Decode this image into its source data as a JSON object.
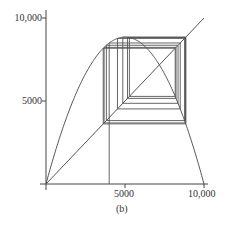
{
  "figure": {
    "caption": "(b)",
    "x_ticks": [
      "5000",
      "10,000"
    ],
    "y_ticks": [
      "10,000",
      "5000"
    ]
  },
  "style": {
    "line_color": "#555555",
    "axis_color": "#444444"
  },
  "chart_data": {
    "type": "line",
    "title": "",
    "caption": "(b)",
    "xlabel": "",
    "ylabel": "",
    "xlim": [
      0,
      10000
    ],
    "ylim": [
      0,
      10000
    ],
    "x_tick_labels": [
      "5000",
      "10,000"
    ],
    "y_tick_labels": [
      "5000",
      "10,000"
    ],
    "grid": false,
    "legend": null,
    "series": [
      {
        "name": "logistic map parabola",
        "description": "f(x) = r x (1 - x/K), r ≈ 3.54, K = 10000, peak ≈ 8850 at x = 5000",
        "r": 3.54,
        "K": 10000,
        "x": [
          0,
          1000,
          2000,
          3000,
          4000,
          5000,
          6000,
          7000,
          8000,
          9000,
          10000
        ],
        "values": [
          0,
          3186,
          5664,
          7434,
          8496,
          8850,
          8496,
          7434,
          5664,
          3186,
          0
        ]
      },
      {
        "name": "identity line y = x",
        "x": [
          0,
          10000
        ],
        "values": [
          0,
          10000
        ]
      },
      {
        "name": "cobweb iterates",
        "x0": 4000,
        "iterates": [
          4000,
          8496,
          4524,
          8770,
          3820,
          8357,
          4861,
          8843,
          3621,
          8177,
          5277,
          8823,
          3677,
          8230,
          5157,
          8841,
          3627
        ]
      }
    ],
    "annotations": [
      "fixed point at ≈ 7175 where parabola meets y = x"
    ]
  }
}
